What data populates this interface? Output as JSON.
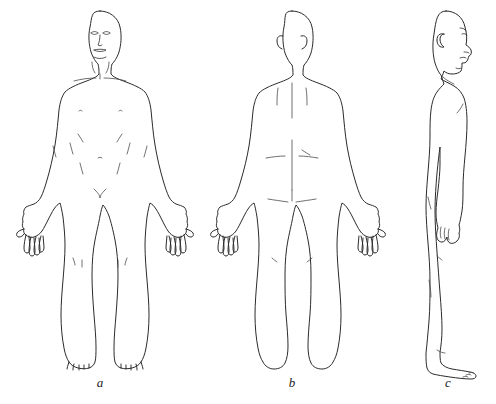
{
  "plate": {
    "background_color": "#ffffff",
    "outline_color": "#2b2b2b",
    "detail_color": "#4a4a4a",
    "subject": "human-body-standing-anatomical-position",
    "view_count": 3
  },
  "figures": [
    {
      "id": "a",
      "label": "a",
      "view": "anterior",
      "center_x": 100,
      "details": [
        "eyes",
        "nose",
        "mouth",
        "clavicles",
        "nipples",
        "navel",
        "rib-margin-lines",
        "knee-creases",
        "toes"
      ]
    },
    {
      "id": "b",
      "label": "b",
      "view": "posterior",
      "center_x": 292,
      "details": [
        "ears",
        "scapular-lines",
        "vertebral-midline",
        "waist-creases",
        "gluteal-cleft",
        "heels"
      ]
    },
    {
      "id": "c",
      "label": "c",
      "view": "lateral",
      "center_x": 448,
      "details": [
        "ear",
        "nose-profile",
        "lips",
        "chin",
        "spinal-curve",
        "hanging-hand",
        "foot-with-toes"
      ]
    }
  ],
  "labels": {
    "a": "a",
    "b": "b",
    "c": "c"
  }
}
